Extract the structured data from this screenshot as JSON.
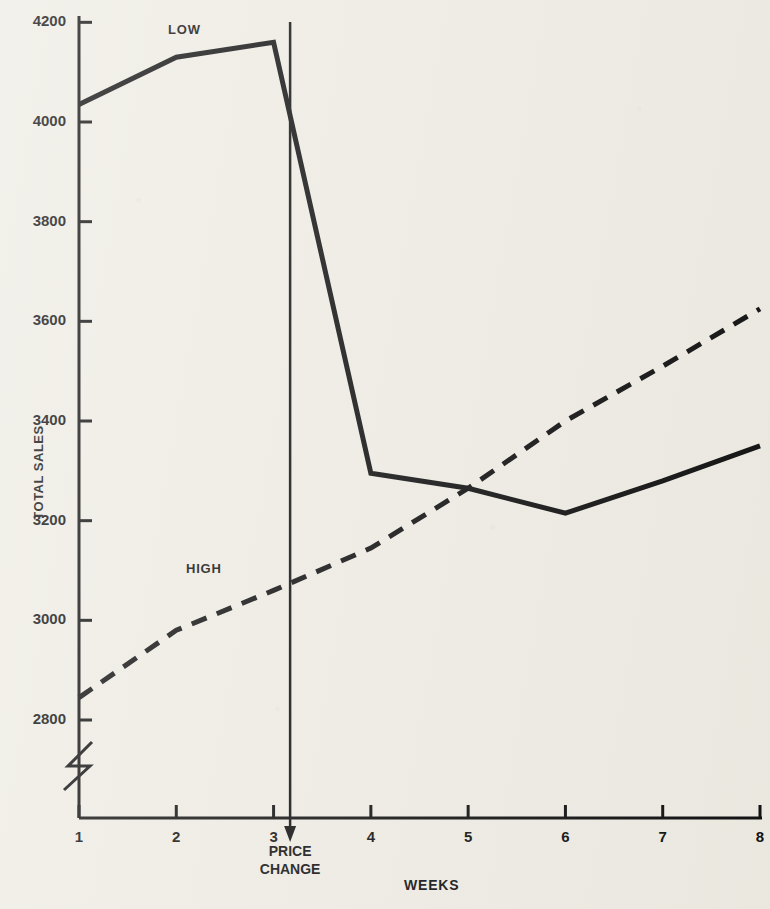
{
  "chart_data": {
    "type": "line",
    "title": "",
    "xlabel": "WEEKS",
    "ylabel": "TOTAL SALES",
    "x": [
      1,
      2,
      3,
      4,
      5,
      6,
      7,
      8
    ],
    "categories": [
      "1",
      "2",
      "3",
      "4",
      "5",
      "6",
      "7",
      "8"
    ],
    "xlim": [
      1,
      8
    ],
    "ylim": [
      2720,
      4200
    ],
    "yticks": [
      2800,
      3000,
      3200,
      3400,
      3600,
      3800,
      4000,
      4200
    ],
    "ytick_labels": [
      "2800",
      "3000",
      "3200",
      "3400",
      "3600",
      "3800",
      "4000",
      "4200"
    ],
    "xticks": [
      1,
      2,
      3,
      4,
      5,
      6,
      7,
      8
    ],
    "grid": false,
    "axis_break": true,
    "legend_position": "inline-labels",
    "series": [
      {
        "name": "LOW",
        "style": "solid",
        "color": "#111111",
        "label_x": 3,
        "values": [
          4035,
          4130,
          4160,
          3295,
          3265,
          3215,
          3280,
          3350
        ]
      },
      {
        "name": "HIGH",
        "style": "dashed",
        "color": "#111111",
        "label_x": 2,
        "values": [
          2845,
          2980,
          3060,
          3145,
          3265,
          3400,
          3510,
          3625
        ]
      }
    ],
    "annotations": [
      {
        "name": "price-change",
        "text_line1": "PRICE",
        "text_line2": "CHANGE",
        "x": 3.17,
        "type": "vertical-line-with-arrow"
      }
    ]
  },
  "series_labels": {
    "low": "LOW",
    "high": "HIGH"
  },
  "axis": {
    "y_title": "TOTAL SALES",
    "x_title": "WEEKS"
  },
  "annotation": {
    "price_change_line1": "PRICE",
    "price_change_line2": "CHANGE"
  },
  "colors": {
    "ink": "#111111",
    "paper": "#efece4"
  }
}
